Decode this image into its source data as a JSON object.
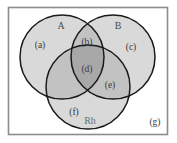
{
  "figure": {
    "name": "blood-group-venn-diagram",
    "universe_border_color": "#8c8c90",
    "circle_stroke_color": "#1a1a1a",
    "background_color": "#ffffff"
  },
  "fills": {
    "single": "#d9d9d9",
    "double": "#c2c2c2",
    "triple": "#a8a8a8",
    "outside": "#ffffff"
  },
  "sets": [
    {
      "id": "A",
      "label": "A",
      "cx": 62,
      "cy": 57,
      "r": 42
    },
    {
      "id": "B",
      "label": "B",
      "cx": 113,
      "cy": 57,
      "r": 42
    },
    {
      "id": "Rh",
      "label": "Rh",
      "cx": 88,
      "cy": 87,
      "r": 42
    }
  ],
  "regions": [
    {
      "id": "a",
      "label": "(a)",
      "x": 40,
      "y": 48,
      "meaning": "A only"
    },
    {
      "id": "b",
      "label": "(b)",
      "x": 87,
      "y": 45,
      "meaning": "A and B only"
    },
    {
      "id": "c",
      "label": "(c)",
      "x": 131,
      "y": 50,
      "meaning": "B only"
    },
    {
      "id": "d",
      "label": "(d)",
      "x": 87,
      "y": 72,
      "meaning": "A and B and Rh"
    },
    {
      "id": "e",
      "label": "(e)",
      "x": 110,
      "y": 88,
      "meaning": "B and Rh only"
    },
    {
      "id": "f",
      "label": "(f)",
      "x": 74,
      "y": 115,
      "meaning": "Rh only"
    },
    {
      "id": "g",
      "label": "(g)",
      "x": 155,
      "y": 125,
      "meaning": "outside all sets"
    }
  ],
  "set_labels": [
    {
      "id": "A",
      "text": "A",
      "x": 61,
      "y": 29
    },
    {
      "id": "B",
      "text": "B",
      "x": 118,
      "y": 29
    },
    {
      "id": "Rh",
      "text": "Rh",
      "x": 90,
      "y": 124
    }
  ],
  "frame": {
    "x": 8,
    "y": 7,
    "width": 160,
    "height": 128
  }
}
